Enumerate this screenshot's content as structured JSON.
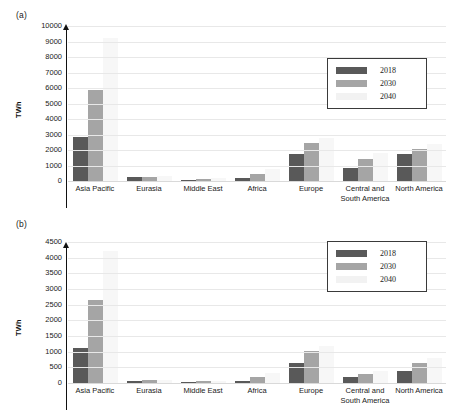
{
  "figure": {
    "panels": [
      {
        "tag": "(a)",
        "ylabel": "TWh",
        "yticks": [
          "10000",
          "9000",
          "8000",
          "7000",
          "6000",
          "5000",
          "4000",
          "3000",
          "2000",
          "1000",
          "0"
        ]
      },
      {
        "tag": "(b)",
        "ylabel": "TWh",
        "yticks": [
          "4500",
          "4000",
          "3500",
          "3000",
          "2500",
          "2000",
          "1500",
          "1000",
          "500",
          "0"
        ]
      }
    ],
    "legend": {
      "entries": [
        {
          "label": "2018",
          "color": "#595959"
        },
        {
          "label": "2030",
          "color": "#a5a5a5"
        },
        {
          "label": "2040",
          "color": "#f2f2f2"
        }
      ]
    },
    "colors": {
      "series_2018": "#595959",
      "series_2030": "#a5a5a5",
      "series_2040": "#f7f7f7",
      "gridline": "#e8e8e8",
      "axis": "#111111",
      "legend_border": "#3a3a3a",
      "text": "#1a1a1a",
      "background": "#ffffff"
    }
  },
  "chart_data": [
    {
      "type": "bar",
      "panel": "(a)",
      "title": "",
      "xlabel": "",
      "ylabel": "TWh",
      "ylim": [
        0,
        10000
      ],
      "ytick_step": 1000,
      "grid": true,
      "legend_position": "upper-right",
      "categories": [
        "Asia Pacific",
        "Eurasia",
        "Middle East",
        "Africa",
        "Europe",
        "Central and South America",
        "North America"
      ],
      "series": [
        {
          "name": "2018",
          "values": [
            2820,
            230,
            60,
            170,
            1720,
            870,
            1730
          ]
        },
        {
          "name": "2030",
          "values": [
            5850,
            270,
            120,
            430,
            2430,
            1440,
            2090
          ]
        },
        {
          "name": "2040",
          "values": [
            9200,
            330,
            190,
            760,
            2800,
            1800,
            2400
          ]
        }
      ]
    },
    {
      "type": "bar",
      "panel": "(b)",
      "title": "",
      "xlabel": "",
      "ylabel": "TWh",
      "ylim": [
        0,
        4500
      ],
      "ytick_step": 500,
      "grid": true,
      "legend_position": "upper-right",
      "categories": [
        "Asia Pacific",
        "Eurasia",
        "Middle East",
        "Africa",
        "Europe",
        "Central and South America",
        "North America"
      ],
      "series": [
        {
          "name": "2018",
          "values": [
            1130,
            60,
            30,
            60,
            640,
            200,
            390
          ]
        },
        {
          "name": "2030",
          "values": [
            2660,
            85,
            55,
            200,
            1010,
            300,
            640
          ]
        },
        {
          "name": "2040",
          "values": [
            4200,
            110,
            80,
            330,
            1180,
            380,
            790
          ]
        }
      ]
    }
  ]
}
